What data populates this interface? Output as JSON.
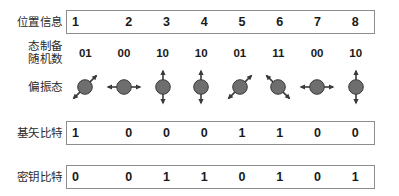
{
  "figure": {
    "colors": {
      "box_border": "#8d8d8d",
      "text": "#1a1a1a",
      "icon_fill": "#6e6e6e",
      "icon_stroke": "#3a3a3a"
    }
  },
  "rows": {
    "position": {
      "label": "位置信息",
      "values": [
        "1",
        "2",
        "3",
        "4",
        "5",
        "6",
        "7",
        "8"
      ]
    },
    "random": {
      "label": "态制备\n随机数",
      "label_line1": "态制备",
      "label_line2": "随机数",
      "values": [
        "01",
        "00",
        "10",
        "10",
        "01",
        "11",
        "00",
        "10"
      ]
    },
    "polarization": {
      "label": "偏振态",
      "icon_names": [
        "polarization-diagonal-icon",
        "polarization-horizontal-icon",
        "polarization-vertical-icon",
        "polarization-vertical-icon",
        "polarization-diagonal-icon",
        "polarization-antidiagonal-icon",
        "polarization-horizontal-icon",
        "polarization-vertical-icon"
      ],
      "angles_deg": [
        45,
        0,
        90,
        90,
        45,
        135,
        0,
        90
      ],
      "descriptions": [
        "diagonal 45°",
        "horizontal 0°",
        "vertical 90°",
        "vertical 90°",
        "diagonal 45°",
        "anti-diagonal 135°",
        "horizontal 0°",
        "vertical 90°"
      ]
    },
    "basis": {
      "label": "基矢比特",
      "values": [
        "1",
        "0",
        "0",
        "0",
        "1",
        "1",
        "0",
        "0"
      ]
    },
    "key": {
      "label": "密钥比特",
      "values": [
        "0",
        "0",
        "1",
        "1",
        "0",
        "1",
        "0",
        "1"
      ]
    }
  }
}
